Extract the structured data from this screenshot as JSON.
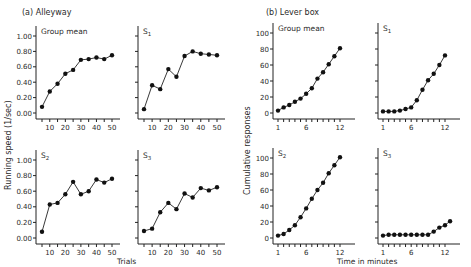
{
  "figure": {
    "panel_a_title": "(a)  Alleyway",
    "panel_b_title": "(b)  Lever box",
    "a_ylabel": "Running speed  (1/sec)",
    "a_xlabel": "Trials",
    "b_ylabel": "Cumulative responses",
    "b_xlabel": "Time in minutes"
  },
  "chart_data": [
    {
      "type": "line",
      "title": "Group mean",
      "group": "(a) Alleyway",
      "xlabel": "Trials",
      "ylabel": "Running speed (1/sec)",
      "x": [
        5,
        10,
        15,
        20,
        25,
        30,
        35,
        40,
        45,
        50
      ],
      "values": [
        0.08,
        0.28,
        0.38,
        0.51,
        0.56,
        0.69,
        0.7,
        0.72,
        0.7,
        0.75
      ],
      "ylim": [
        0,
        1.0
      ],
      "yticks": [
        "0.00",
        "0.20",
        "0.40",
        "0.60",
        "0.80",
        "1.00"
      ],
      "xticks": [
        10,
        20,
        30,
        40,
        50
      ]
    },
    {
      "type": "line",
      "title": "S1",
      "group": "(a) Alleyway",
      "xlabel": "Trials",
      "ylabel": "Running speed (1/sec)",
      "x": [
        5,
        10,
        15,
        20,
        25,
        30,
        35,
        40,
        45,
        50
      ],
      "values": [
        0.05,
        0.36,
        0.31,
        0.57,
        0.47,
        0.74,
        0.8,
        0.77,
        0.76,
        0.75
      ],
      "ylim": [
        0,
        1.0
      ],
      "xticks": [
        10,
        20,
        30,
        40,
        50
      ]
    },
    {
      "type": "line",
      "title": "S2",
      "group": "(a) Alleyway",
      "xlabel": "Trials",
      "ylabel": "Running speed (1/sec)",
      "x": [
        5,
        10,
        15,
        20,
        25,
        30,
        35,
        40,
        45,
        50
      ],
      "values": [
        0.08,
        0.43,
        0.45,
        0.56,
        0.72,
        0.56,
        0.6,
        0.75,
        0.71,
        0.76
      ],
      "ylim": [
        0,
        1.0
      ],
      "yticks": [
        "0.00",
        "0.20",
        "0.40",
        "0.60",
        "0.80",
        "1.00"
      ],
      "xticks": [
        10,
        20,
        30,
        40,
        50
      ]
    },
    {
      "type": "line",
      "title": "S3",
      "group": "(a) Alleyway",
      "xlabel": "Trials",
      "ylabel": "Running speed (1/sec)",
      "x": [
        5,
        10,
        15,
        20,
        25,
        30,
        35,
        40,
        45,
        50
      ],
      "values": [
        0.09,
        0.12,
        0.33,
        0.45,
        0.37,
        0.57,
        0.52,
        0.64,
        0.61,
        0.65
      ],
      "ylim": [
        0,
        1.0
      ],
      "xticks": [
        10,
        20,
        30,
        40,
        50
      ]
    },
    {
      "type": "line",
      "title": "Group mean",
      "group": "(b) Lever box",
      "xlabel": "Time in minutes",
      "ylabel": "Cumulative responses",
      "x": [
        1,
        2,
        3,
        4,
        5,
        6,
        7,
        8,
        9,
        10,
        11,
        12
      ],
      "values": [
        3,
        7,
        10,
        14,
        18,
        24,
        31,
        43,
        51,
        61,
        71,
        81
      ],
      "ylim": [
        0,
        100
      ],
      "yticks": [
        "0",
        "20",
        "40",
        "60",
        "80",
        "100"
      ],
      "xticks": [
        1,
        6,
        12
      ]
    },
    {
      "type": "line",
      "title": "S1",
      "group": "(b) Lever box",
      "xlabel": "Time in minutes",
      "ylabel": "Cumulative responses",
      "x": [
        1,
        2,
        3,
        4,
        5,
        6,
        7,
        8,
        9,
        10,
        11,
        12
      ],
      "values": [
        2,
        2,
        2,
        3,
        5,
        7,
        16,
        29,
        41,
        49,
        60,
        72
      ],
      "ylim": [
        0,
        100
      ],
      "xticks": [
        1,
        6,
        12
      ]
    },
    {
      "type": "line",
      "title": "S2",
      "group": "(b) Lever box",
      "xlabel": "Time in minutes",
      "ylabel": "Cumulative responses",
      "x": [
        1,
        2,
        3,
        4,
        5,
        6,
        7,
        8,
        9,
        10,
        11,
        12
      ],
      "values": [
        3,
        5,
        10,
        16,
        26,
        37,
        49,
        60,
        69,
        81,
        91,
        101
      ],
      "ylim": [
        0,
        100
      ],
      "yticks": [
        "0",
        "20",
        "40",
        "60",
        "80",
        "100"
      ],
      "xticks": [
        1,
        6,
        12
      ]
    },
    {
      "type": "line",
      "title": "S3",
      "group": "(b) Lever box",
      "xlabel": "Time in minutes",
      "ylabel": "Cumulative responses",
      "x": [
        1,
        2,
        3,
        4,
        5,
        6,
        7,
        8,
        9,
        10,
        11,
        12,
        13
      ],
      "values": [
        3,
        4,
        4,
        4,
        4,
        4,
        4,
        4,
        4,
        8,
        13,
        16,
        21
      ],
      "ylim": [
        0,
        100
      ],
      "xticks": [
        1,
        6,
        12
      ]
    }
  ]
}
